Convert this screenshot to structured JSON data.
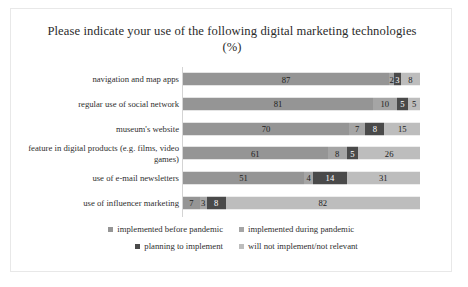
{
  "chart_data": {
    "type": "bar",
    "orientation": "horizontal",
    "stacked": true,
    "normalized_percent": true,
    "title": "Please indicate your use of the following digital marketing technologies (%)",
    "xlabel": "",
    "ylabel": "",
    "xlim": [
      0,
      100
    ],
    "grid": false,
    "legend_position": "bottom",
    "categories": [
      "navigation and map apps",
      "regular use of social network",
      "museum's website",
      "feature in digital products (e.g. films, video games)",
      "use of e-mail newsletters",
      "use of influencer marketing"
    ],
    "series": [
      {
        "name": "implemented before pandemic",
        "color": "#959595",
        "values": [
          87,
          81,
          70,
          61,
          51,
          7
        ]
      },
      {
        "name": "implemented during pandemic",
        "color": "#a5a5a5",
        "values": [
          2,
          10,
          7,
          8,
          4,
          3
        ]
      },
      {
        "name": "planning to implement",
        "color": "#4a4a4a",
        "values": [
          3,
          5,
          8,
          5,
          14,
          8
        ]
      },
      {
        "name": "will not implement/not relevant",
        "color": "#bdbdbd",
        "values": [
          8,
          5,
          15,
          26,
          31,
          82
        ]
      }
    ]
  }
}
